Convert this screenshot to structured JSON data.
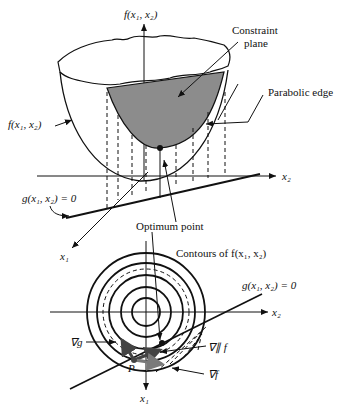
{
  "figure": {
    "top_panel": {
      "axis_f": "f(x₁, x₂)",
      "surface_label": "f(x₁, x₂)",
      "constraint_plane_line1": "Constraint",
      "constraint_plane_line2": "plane",
      "parabolic_edge": "Parabolic edge",
      "constraint_eq": "g(x₁, x₂) = 0",
      "axis_x1": "x₁",
      "axis_x2": "x₂",
      "optimum": "Optimum point"
    },
    "bottom_panel": {
      "contours": "Contours of f(x₁, x₂)",
      "constraint_eq": "g(x₁, x₂) = 0",
      "axis_x1": "x₁",
      "axis_x2": "x₂",
      "grad_g": "∇g",
      "grad_par_f": "∇∥ f",
      "grad_f": "∇f",
      "point_p": "P"
    },
    "colors": {
      "stroke": "#111111",
      "plane_fill": "#8c8c8c",
      "arrow_gray": "#7a7a7a",
      "arrow_dark": "#444444"
    }
  }
}
